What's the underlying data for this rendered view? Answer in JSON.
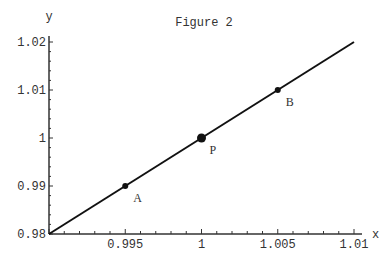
{
  "chart_data": {
    "type": "line",
    "title": "Figure 2",
    "xlabel": "x",
    "ylabel": "y",
    "xlim": [
      0.99,
      1.01
    ],
    "ylim": [
      0.98,
      1.02
    ],
    "x_ticks": [
      "0.995",
      "1",
      "1.005",
      "1.01"
    ],
    "y_ticks": [
      "0.98",
      "0.99",
      "1",
      "1.01",
      "1.02"
    ],
    "grid": false,
    "series": [
      {
        "name": "line",
        "x": [
          0.99,
          1.01
        ],
        "y": [
          0.98,
          1.02
        ]
      }
    ],
    "points": [
      {
        "label": "A",
        "x": 0.995,
        "y": 0.99
      },
      {
        "label": "P",
        "x": 1.0,
        "y": 1.0
      },
      {
        "label": "B",
        "x": 1.005,
        "y": 1.01
      }
    ]
  }
}
